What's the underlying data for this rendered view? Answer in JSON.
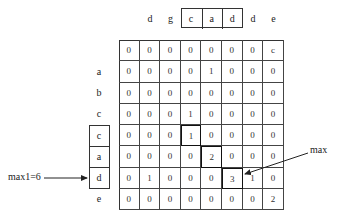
{
  "diagram": {
    "column_labels": [
      "d",
      "g",
      "c",
      "a",
      "d",
      "d",
      "e"
    ],
    "column_label_highlight_indices": [
      2,
      3,
      4
    ],
    "row_labels": [
      "",
      "a",
      "b",
      "c",
      "c",
      "a",
      "d",
      "e"
    ],
    "row_label_highlight_indices": [
      4,
      5,
      6
    ],
    "matrix": [
      [
        "0",
        "0",
        "0",
        "0",
        "0",
        "0",
        "0",
        "c"
      ],
      [
        "0",
        "0",
        "0",
        "0",
        "1",
        "0",
        "0",
        "0"
      ],
      [
        "0",
        "0",
        "0",
        "0",
        "0",
        "0",
        "0",
        "0"
      ],
      [
        "0",
        "0",
        "0",
        "1",
        "0",
        "0",
        "0",
        "0"
      ],
      [
        "0",
        "0",
        "0",
        "1",
        "0",
        "0",
        "0",
        "0"
      ],
      [
        "0",
        "0",
        "0",
        "0",
        "2",
        "0",
        "0",
        "0"
      ],
      [
        "0",
        "1",
        "0",
        "0",
        "0",
        "3",
        "1",
        "0"
      ],
      [
        "0",
        "0",
        "0",
        "0",
        "0",
        "0",
        "0",
        "2"
      ]
    ],
    "highlighted_cells": [
      [
        4,
        3
      ],
      [
        5,
        4
      ],
      [
        6,
        5
      ]
    ],
    "annotations": {
      "left_label": "max1=6",
      "right_label": "max"
    }
  }
}
